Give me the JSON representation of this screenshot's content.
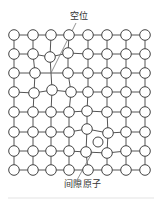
{
  "figure": {
    "type": "crystal-lattice-point-defects",
    "grid_rows": 8,
    "grid_cols": 8,
    "colors": {
      "line": "#555555",
      "atom_fill": "#ffffff",
      "atom_stroke": "#444444",
      "pointer": "#777777"
    }
  },
  "labels": {
    "vacancy": "空位",
    "interstitial": "间隙原子"
  },
  "defects": {
    "vacancy": {
      "row": 3,
      "col": 3,
      "x": 51,
      "y": 73
    },
    "interstitial": {
      "x": 98,
      "y": 142
    }
  },
  "pointers": {
    "vacancy": {
      "x1": 76,
      "y1": 23,
      "x2": 51,
      "y2": 73
    },
    "interstitial": {
      "x1": 77,
      "y1": 180,
      "x2": 92,
      "y2": 153
    }
  }
}
